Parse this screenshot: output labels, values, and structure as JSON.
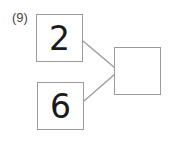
{
  "problem": {
    "label": "(9)",
    "top_number": "2",
    "bottom_number": "6",
    "answer": ""
  }
}
